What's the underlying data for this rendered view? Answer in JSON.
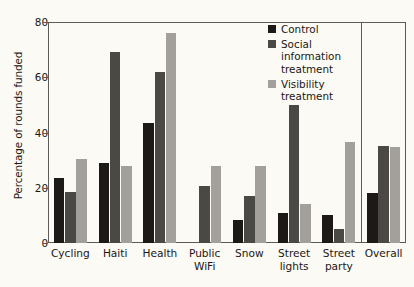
{
  "chart_data": {
    "type": "bar",
    "title": "",
    "xlabel": "",
    "ylabel": "Percentage of rounds funded",
    "ylim": [
      0,
      80
    ],
    "yticks": [
      0,
      20,
      40,
      60,
      80
    ],
    "ytick_labels": [
      "0",
      "20",
      "40",
      "60",
      "80"
    ],
    "grid": false,
    "legend_position": "top-right-inside",
    "categories": [
      "Cycling",
      "Haiti",
      "Health",
      "Public\nWiFi",
      "Snow",
      "Street\nlights",
      "Street\nparty",
      "Overall"
    ],
    "series": [
      {
        "name": "Control",
        "color": "#1d1916",
        "values": [
          23.5,
          29.0,
          43.5,
          0,
          8.5,
          11.0,
          10.0,
          18.0
        ]
      },
      {
        "name": "Social information treatment",
        "color": "#4b4946",
        "values": [
          18.5,
          69.0,
          62.0,
          20.5,
          17.0,
          50.0,
          5.0,
          35.0
        ]
      },
      {
        "name": "Visibility treatment",
        "color": "#a3a09c",
        "values": [
          30.5,
          28.0,
          76.0,
          28.0,
          28.0,
          14.0,
          36.5,
          34.8
        ]
      }
    ],
    "annotations": [
      {
        "name": "overall-separator",
        "type": "vertical-line",
        "after_category": "Street party"
      }
    ]
  },
  "legend": {
    "entries": [
      {
        "label": "Control",
        "swatch": "control"
      },
      {
        "label": "Social\ninformation\ntreatment",
        "swatch": "social"
      },
      {
        "label": "Visibility\ntreatment",
        "swatch": "visibility"
      }
    ]
  },
  "colors": {
    "control": "#1d1916",
    "social": "#4b4946",
    "visibility": "#a3a09c",
    "axis": "#5d5b57",
    "text": "#1b1713",
    "background": "#fbfaf4"
  }
}
